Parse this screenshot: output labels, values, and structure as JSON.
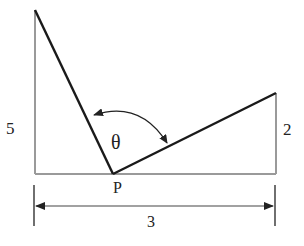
{
  "diagram": {
    "labels": {
      "left_height": "5",
      "right_height": "2",
      "point": "P",
      "angle": "θ",
      "base_distance": "3"
    },
    "colors": {
      "pole": "#9a9a9a",
      "ground": "#9a9a9a",
      "wire": "#1a1a1a",
      "dimension": "#333333",
      "text": "#222222"
    }
  }
}
